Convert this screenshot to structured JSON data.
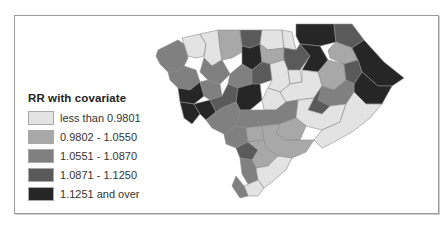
{
  "legend": {
    "title": "RR with covariate",
    "items": [
      {
        "label": "less than 0.9801",
        "color": "#e3e3e3"
      },
      {
        "label": "0.9802 - 1.0550",
        "color": "#a8a8a8"
      },
      {
        "label": "1.0551 - 1.0870",
        "color": "#808080"
      },
      {
        "label": "1.0871 - 1.1250",
        "color": "#5a5a5a"
      },
      {
        "label": "1.1251 and over",
        "color": "#262626"
      }
    ]
  },
  "map": {
    "region": "South Carolina counties",
    "classes": [
      "less than 0.9801",
      "0.9802 - 1.0550",
      "1.0551 - 1.0870",
      "1.0871 - 1.1250",
      "1.1251 and over"
    ]
  }
}
